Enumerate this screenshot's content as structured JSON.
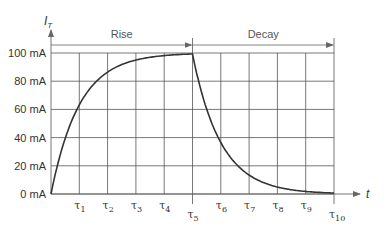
{
  "chart_data": {
    "type": "line",
    "title": "",
    "xlabel": "t",
    "ylabel": "I_T",
    "ylabel_main": "I",
    "ylabel_sub": "T",
    "y_unit": "mA",
    "ylim": [
      0,
      100
    ],
    "grid": true,
    "y_ticks": [
      {
        "value": 0,
        "label": "0 mA"
      },
      {
        "value": 20,
        "label": "20 mA"
      },
      {
        "value": 40,
        "label": "40 mA"
      },
      {
        "value": 60,
        "label": "60 mA"
      },
      {
        "value": 80,
        "label": "80 mA"
      },
      {
        "value": 100,
        "label": "100 mA"
      }
    ],
    "x_ticks": [
      {
        "index": 1,
        "label": "τ",
        "sub": "1"
      },
      {
        "index": 2,
        "label": "τ",
        "sub": "2"
      },
      {
        "index": 3,
        "label": "τ",
        "sub": "3"
      },
      {
        "index": 4,
        "label": "τ",
        "sub": "4"
      },
      {
        "index": 5,
        "label": "τ",
        "sub": "5"
      },
      {
        "index": 6,
        "label": "τ",
        "sub": "6"
      },
      {
        "index": 7,
        "label": "τ",
        "sub": "7"
      },
      {
        "index": 8,
        "label": "τ",
        "sub": "8"
      },
      {
        "index": 9,
        "label": "τ",
        "sub": "9"
      },
      {
        "index": 10,
        "label": "τ",
        "sub": "10"
      }
    ],
    "annotations": [
      {
        "label": "Rise",
        "from": 0,
        "to": 5
      },
      {
        "label": "Decay",
        "from": 5,
        "to": 10
      }
    ],
    "series": [
      {
        "name": "I_T",
        "x": [
          0,
          1,
          2,
          3,
          4,
          5,
          6,
          7,
          8,
          9,
          10
        ],
        "values": [
          0,
          63,
          86,
          95,
          98,
          99,
          37,
          14,
          5,
          2,
          1
        ]
      }
    ],
    "curve_color": "#333333",
    "grid_color": "#555555"
  }
}
